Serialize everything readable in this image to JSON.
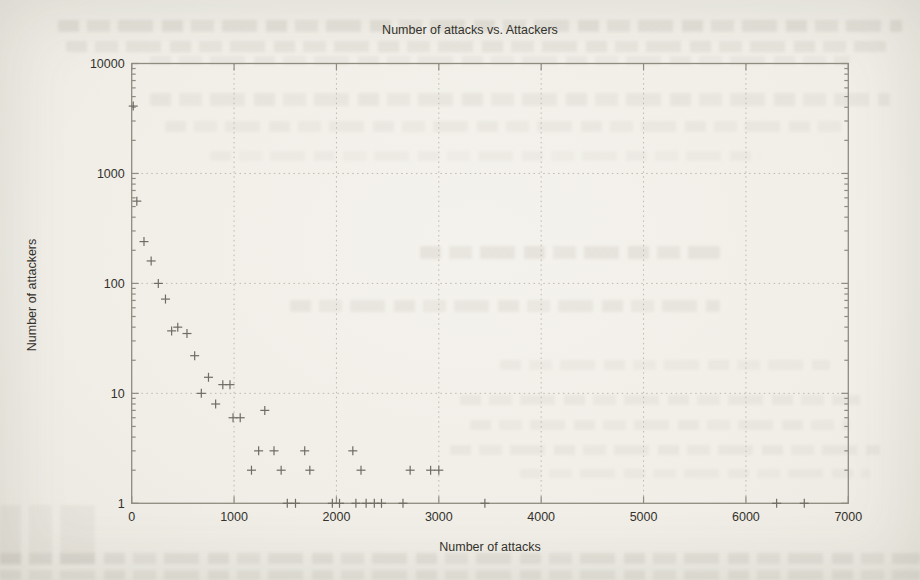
{
  "page": {
    "kind": "scanned book page with embedded gnuplot figure",
    "paper_color": "#f1efe8"
  },
  "colors": {
    "text": "#34322c",
    "plot_border": "#8e8b81",
    "gridline": "#bdb9ae",
    "marker": "#6e6c63"
  },
  "chart_data": {
    "type": "scatter",
    "marker": "plus",
    "title": "Number of attacks vs. Attackers",
    "xlabel": "Number of attacks",
    "ylabel": "Number of attackers",
    "grid": true,
    "legend": "none",
    "x_axis": {
      "scale": "linear",
      "min": 0,
      "max": 7000,
      "tick_step": 1000,
      "tick_labels": [
        "0",
        "1000",
        "2000",
        "3000",
        "4000",
        "5000",
        "6000",
        "7000"
      ]
    },
    "y_axis": {
      "scale": "log",
      "min": 1,
      "max": 10000,
      "ticks": [
        1,
        10,
        100,
        1000,
        10000
      ],
      "tick_labels": [
        "1",
        "10",
        "100",
        "1000",
        "10000"
      ]
    },
    "points": [
      [
        15,
        4100
      ],
      [
        50,
        560
      ],
      [
        120,
        240
      ],
      [
        190,
        160
      ],
      [
        260,
        100
      ],
      [
        330,
        72
      ],
      [
        390,
        37
      ],
      [
        450,
        40
      ],
      [
        540,
        35
      ],
      [
        615,
        22
      ],
      [
        680,
        10
      ],
      [
        750,
        14
      ],
      [
        820,
        8
      ],
      [
        890,
        12
      ],
      [
        960,
        12
      ],
      [
        990,
        6
      ],
      [
        1060,
        6
      ],
      [
        1170,
        2
      ],
      [
        1240,
        3
      ],
      [
        1300,
        7
      ],
      [
        1390,
        3
      ],
      [
        1460,
        2
      ],
      [
        1520,
        1
      ],
      [
        1600,
        1
      ],
      [
        1690,
        3
      ],
      [
        1740,
        2
      ],
      [
        1960,
        1
      ],
      [
        2030,
        1
      ],
      [
        2160,
        3
      ],
      [
        2190,
        1
      ],
      [
        2240,
        2
      ],
      [
        2290,
        1
      ],
      [
        2370,
        1
      ],
      [
        2440,
        1
      ],
      [
        2650,
        1
      ],
      [
        2720,
        2
      ],
      [
        2920,
        2
      ],
      [
        3000,
        2
      ],
      [
        3450,
        1
      ],
      [
        6300,
        1
      ],
      [
        6570,
        1
      ]
    ]
  }
}
